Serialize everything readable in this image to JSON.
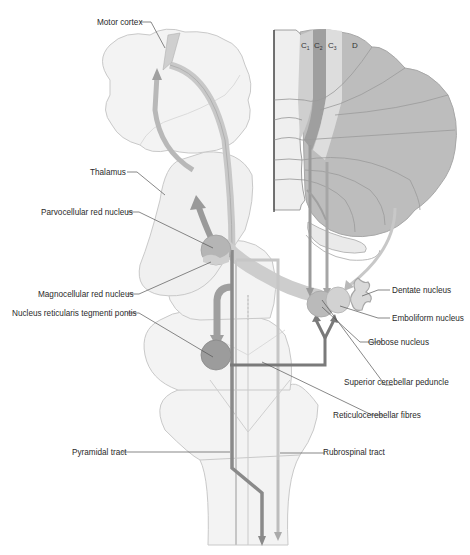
{
  "diagram": {
    "colors": {
      "background": "#ffffff",
      "outline_light": "#c9c9c9",
      "structure_fill": "#f1f1f1",
      "cerebellum_fill": "#bdbdbd",
      "tract_dark": "#808080",
      "tract_mid": "#a6a6a6",
      "tract_light": "#c8c8c8",
      "nucleus_dark": "#9c9c9c",
      "label_text": "#2a2a2a",
      "leader_line": "#555555"
    },
    "cerebellar_zones": [
      {
        "label": "C",
        "sub": "1"
      },
      {
        "label": "C",
        "sub": "2"
      },
      {
        "label": "C",
        "sub": "3"
      },
      {
        "label": "D",
        "sub": ""
      }
    ],
    "labels": {
      "motor_cortex": "Motor cortex",
      "thalamus": "Thalamus",
      "parvocellular_red_nucleus": "Parvocellular red nucleus",
      "magnocellular_red_nucleus": "Magnocellular red nucleus",
      "nucleus_reticularis_tegmenti_pontis": "Nucleus reticularis tegmenti pontis",
      "dentate_nucleus": "Dentate nucleus",
      "emboliform_nucleus": "Emboliform nucleus",
      "globose_nucleus": "Globose nucleus",
      "superior_cerebellar_peduncle": "Superior cerebellar peduncle",
      "reticulocerebellar_fibres": "Reticulocerebellar fibres",
      "pyramidal_tract": "Pyramidal tract",
      "rubrospinal_tract": "Rubrospinal tract"
    }
  }
}
